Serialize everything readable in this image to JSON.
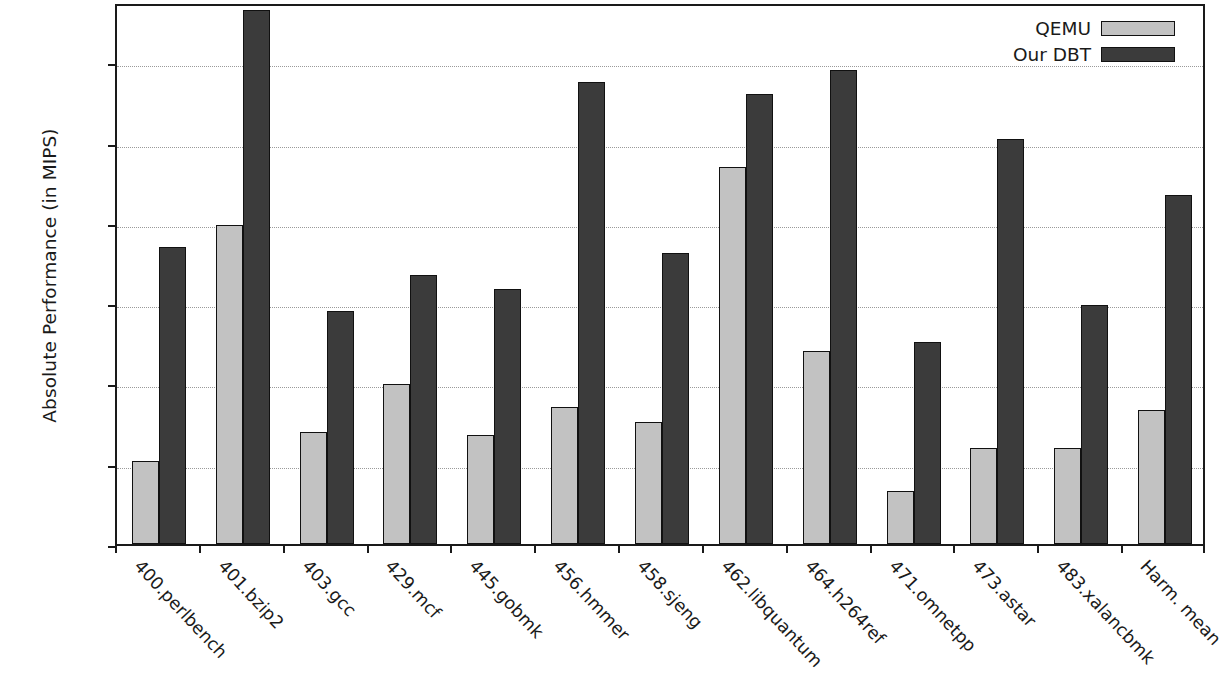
{
  "chart_data": {
    "type": "bar",
    "title": "",
    "xlabel": "",
    "ylabel": "Absolute Performance (in MIPS)",
    "ylim": [
      0,
      1350
    ],
    "yticks": [
      0,
      200,
      400,
      600,
      800,
      1000,
      1200
    ],
    "ytick_labels": [
      "0",
      "200",
      "400",
      "600",
      "800",
      "1000",
      "1200"
    ],
    "grid": true,
    "legend_position": "top-right",
    "categories": [
      "400.perlbench",
      "401.bzip2",
      "403.gcc",
      "429.mcf",
      "445.gobmk",
      "456.hmmer",
      "458.sjeng",
      "462.libquantum",
      "464.h264ref",
      "471.omnetpp",
      "473.astar",
      "483.xalancbmk",
      "Harm. mean"
    ],
    "series": [
      {
        "name": "QEMU",
        "color": "#c2c2c2",
        "values": [
          207,
          795,
          280,
          398,
          272,
          342,
          303,
          940,
          480,
          133,
          240,
          240,
          333
        ]
      },
      {
        "name": "Our DBT",
        "color": "#3b3b3b",
        "values": [
          740,
          1330,
          580,
          670,
          635,
          1150,
          725,
          1120,
          1180,
          503,
          1010,
          595,
          870
        ]
      }
    ]
  },
  "legend": {
    "entries": [
      {
        "label": "QEMU",
        "color": "#c2c2c2"
      },
      {
        "label": "Our DBT",
        "color": "#3b3b3b"
      }
    ]
  }
}
